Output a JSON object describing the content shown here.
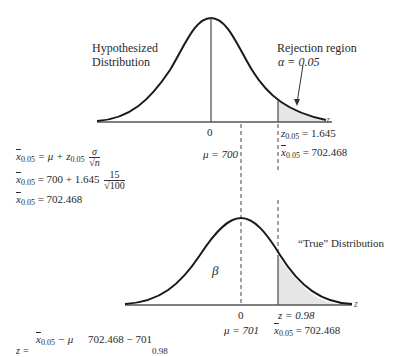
{
  "top": {
    "label_line1": "Hypothesized",
    "label_line2": "Distribution",
    "rejection_label": "Rejection region",
    "alpha_label": "α = 0.05",
    "axis_var": "z",
    "zero_tick": "0",
    "z_crit_text": "= 1.645",
    "z_crit_var": "z",
    "z_crit_sub": "0.05",
    "mu_text": "μ = 700",
    "xbar_var": "x",
    "xbar_sub": "0.05",
    "xbar_text": "= 702.468"
  },
  "equations": {
    "line1_lhs_var": "x",
    "line1_lhs_sub": "0.05",
    "line1_rhs": "= μ + ",
    "line1_z": "z",
    "line1_z_sub": "0.05",
    "line1_num": "σ",
    "line1_den": "√n",
    "line2_lhs_var": "x",
    "line2_lhs_sub": "0.05",
    "line2_rhs": "= 700 + 1.645",
    "line2_num": "15",
    "line2_den": "√100",
    "line3_lhs_var": "x",
    "line3_lhs_sub": "0.05",
    "line3_rhs": "= 702.468"
  },
  "bottom": {
    "true_label": "“True” Distribution",
    "beta_label": "β",
    "axis_var": "z",
    "zero_tick": "0",
    "z_text": "z = 0.98",
    "mu_text": "μ = 701",
    "xbar_var": "x",
    "xbar_sub": "0.05",
    "xbar_text": "= 702.468"
  },
  "footer": {
    "z_lhs": "z =",
    "num_var": "x",
    "num_sub": "0.05",
    "num_rest": " − μ",
    "mid": "702.468 − 701",
    "result": "0.98"
  },
  "colors": {
    "curve": "#1a1a1a",
    "shade": "#e6e6e6",
    "axis": "#555555"
  }
}
